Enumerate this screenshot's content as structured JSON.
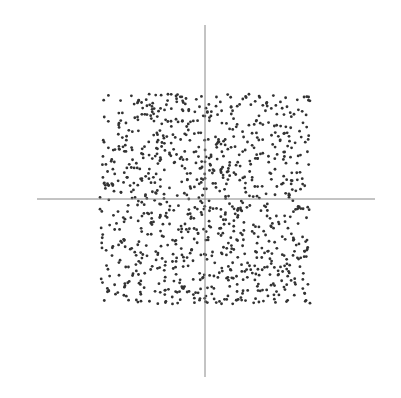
{
  "chart_data": {
    "type": "scatter",
    "title": "",
    "xlabel": "",
    "ylabel": "",
    "xlim": [
      -1.5,
      1.5
    ],
    "ylim": [
      -1.5,
      1.5
    ],
    "grid": false,
    "legend": null,
    "axes": "centered crosshair lines through origin, no ticks or labels",
    "distribution": "uniform random points within square [-1, 1] x [-1, 1]",
    "point_count": 1000,
    "point_color": "#333333",
    "axis_color": "#888888",
    "seed": 12345,
    "region": {
      "x": [
        -1,
        1
      ],
      "y": [
        -1,
        1
      ]
    }
  },
  "layout": {
    "origin_px": [
      205,
      199
    ],
    "unit_px": 105,
    "x_axis_px": [
      37,
      375
    ],
    "y_axis_px": [
      25,
      377
    ],
    "point_radius": 1.4
  }
}
